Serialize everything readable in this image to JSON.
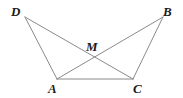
{
  "figure": {
    "kind": "geometry-diagram",
    "background_color": "#ffffff",
    "line_color": "#8a8a8a",
    "label_color": "#1a1a1a",
    "line_width": 1,
    "width": 183,
    "height": 98
  },
  "labels": {
    "d": "D",
    "b": "B",
    "m": "M",
    "a": "A",
    "c": "C"
  },
  "points": {
    "D": {
      "x": 25,
      "y": 17
    },
    "B": {
      "x": 163,
      "y": 17
    },
    "M": {
      "x": 95,
      "y": 57
    },
    "A": {
      "x": 57,
      "y": 79
    },
    "C": {
      "x": 133,
      "y": 79
    }
  },
  "segments": [
    {
      "name": "segment-DA",
      "from": "D",
      "to": "A"
    },
    {
      "name": "segment-DC",
      "from": "D",
      "to": "C"
    },
    {
      "name": "segment-BC",
      "from": "B",
      "to": "C"
    },
    {
      "name": "segment-BA",
      "from": "B",
      "to": "A"
    },
    {
      "name": "segment-AC",
      "from": "A",
      "to": "C"
    }
  ]
}
